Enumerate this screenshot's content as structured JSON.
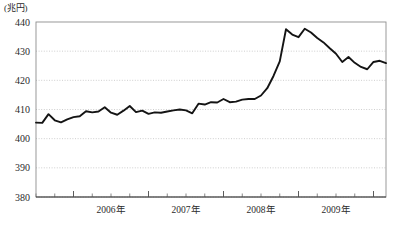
{
  "chart_data": {
    "type": "line",
    "title": "",
    "subtitle": "",
    "unit_label": "(兆円)",
    "xlabel": "",
    "ylabel": "",
    "ylim": [
      380,
      440
    ],
    "ytick_labels": [
      "440",
      "430",
      "420",
      "410",
      "400",
      "390",
      "380"
    ],
    "ytick_values": [
      440,
      430,
      420,
      410,
      400,
      390,
      380
    ],
    "ytick_step": 10,
    "grid": true,
    "grid_axis": "y",
    "legend": false,
    "legend_position": "none",
    "xtick_labels": [
      "2006年",
      "2007年",
      "2008年",
      "2009年"
    ],
    "xtick_values": [
      2006,
      2007,
      2008,
      2009
    ],
    "x_minor_ticks_per_year": 4,
    "x_range_start": "2005-07",
    "x_range_end": "2010-03",
    "series": [
      {
        "name": "",
        "color": "#141414",
        "x": [
          "2005-07",
          "2005-08",
          "2005-09",
          "2005-10",
          "2005-11",
          "2005-12",
          "2006-01",
          "2006-02",
          "2006-03",
          "2006-04",
          "2006-05",
          "2006-06",
          "2006-07",
          "2006-08",
          "2006-09",
          "2006-10",
          "2006-11",
          "2006-12",
          "2007-01",
          "2007-02",
          "2007-03",
          "2007-04",
          "2007-05",
          "2007-06",
          "2007-07",
          "2007-08",
          "2007-09",
          "2007-10",
          "2007-11",
          "2007-12",
          "2008-01",
          "2008-02",
          "2008-03",
          "2008-04",
          "2008-05",
          "2008-06",
          "2008-07",
          "2008-08",
          "2008-09",
          "2008-10",
          "2008-11",
          "2008-12",
          "2009-01",
          "2009-02",
          "2009-03",
          "2009-04",
          "2009-05",
          "2009-06",
          "2009-07",
          "2009-08",
          "2009-09",
          "2009-10",
          "2009-11",
          "2009-12",
          "2010-01",
          "2010-02",
          "2010-03"
        ],
        "values": [
          405.5,
          405.4,
          408.4,
          406.3,
          405.6,
          406.6,
          407.4,
          407.7,
          409.4,
          409.0,
          409.3,
          410.8,
          408.9,
          408.2,
          409.6,
          411.2,
          409.1,
          409.6,
          408.5,
          409.0,
          408.9,
          409.3,
          409.7,
          410.0,
          409.7,
          408.7,
          412.0,
          411.7,
          412.5,
          412.4,
          413.6,
          412.5,
          412.7,
          413.4,
          413.6,
          413.6,
          414.8,
          417.3,
          421.5,
          426.5,
          437.5,
          435.7,
          434.8,
          437.7,
          436.4,
          434.5,
          433.0,
          431.0,
          429.1,
          426.3,
          428.0,
          426.0,
          424.6,
          423.8,
          426.3,
          426.7,
          425.9
        ]
      }
    ]
  }
}
